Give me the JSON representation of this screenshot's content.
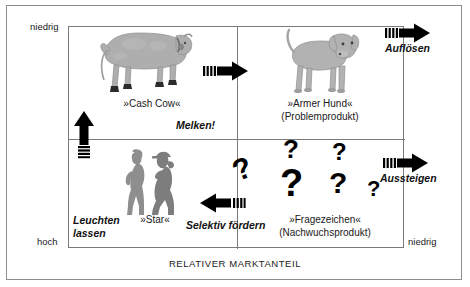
{
  "diagram": {
    "title_axes": {
      "y_axis_label": "MARKTWACHSTUM",
      "x_axis_label": "RELATIVER MARKTANTEIL"
    },
    "ticks": {
      "y_top": "niedrig",
      "y_bottom": "hoch",
      "x_right": "niedrig"
    },
    "quadrants": [
      {
        "key": "cash-cow",
        "label": "»Cash Cow«",
        "sublabel": "",
        "strategy": "Melken!",
        "icon": "cow-icon"
      },
      {
        "key": "poor-dog",
        "label": "»Armer Hund«",
        "sublabel": "(Problemprodukt)",
        "strategy": "Auflösen",
        "icon": "dog-icon"
      },
      {
        "key": "star",
        "label": "»Star«",
        "sublabel": "",
        "strategy": "Leuchten lassen",
        "strategy_line1": "Leuchten",
        "strategy_line2": "lassen",
        "icon": "star-people-icon"
      },
      {
        "key": "question-mark",
        "label": "»Fragezeichen«",
        "sublabel": "(Nachwuchsprodukt)",
        "strategy": "Selektiv fördern",
        "icon": "question-marks-icon"
      }
    ],
    "arrows": [
      {
        "key": "melken",
        "direction": "right",
        "label": ""
      },
      {
        "key": "aufloesen",
        "direction": "right",
        "label": "Auflösen"
      },
      {
        "key": "aussteigen",
        "direction": "right",
        "label": "Aussteigen"
      },
      {
        "key": "selektiv-foerdern",
        "direction": "left",
        "label": "Selektiv fördern"
      },
      {
        "key": "star-up",
        "direction": "up",
        "label": ""
      }
    ],
    "colors": {
      "frame": "#8d8d8d",
      "matrix_border": "#7a7a7a",
      "artwork_gray": "#a9a9a9",
      "arrow_black": "#000000",
      "text": "#1a1a1a"
    }
  }
}
